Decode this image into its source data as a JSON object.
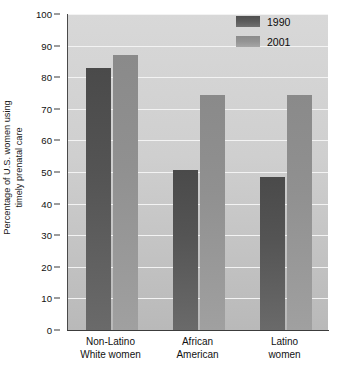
{
  "chart_data": {
    "type": "bar",
    "title": "",
    "xlabel": "",
    "ylabel_line1": "Percentage of U.S. women using",
    "ylabel_line2": "timely prenatal care",
    "categories": [
      {
        "line1": "Non-Latino",
        "line2": "White women"
      },
      {
        "line1": "African",
        "line2": "American"
      },
      {
        "line1": "Latino",
        "line2": "women"
      }
    ],
    "series": [
      {
        "name": "1990",
        "color": "#545454",
        "values": [
          83,
          50.5,
          48.5
        ]
      },
      {
        "name": "2001",
        "color": "#909090",
        "values": [
          87,
          74.5,
          74.5
        ]
      }
    ],
    "ylim": [
      0,
      100
    ],
    "yticks": [
      0,
      10,
      20,
      30,
      40,
      50,
      60,
      70,
      80,
      90,
      100
    ],
    "grid": true,
    "legend_position": "top-right",
    "plot_background": "#cfcfcf"
  }
}
